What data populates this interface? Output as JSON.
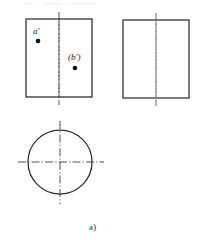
{
  "figure": {
    "type": "engineering-orthographic-projection",
    "caption": "a)",
    "background_color": "#ffffff",
    "line_color": "#2b2b2b",
    "centerline_color_primary": "#3a3a3a",
    "centerline_color_secondary": "#9a9a9a",
    "point_color": "#101010",
    "top_artifact_text": "— ·· —— · ———",
    "views": [
      {
        "id": "front-view",
        "name": "front-view-rectangle",
        "shape": "rectangle",
        "x": 26,
        "y": 19,
        "width": 66,
        "height": 78,
        "centerline": {
          "orientation": "vertical",
          "x": 59,
          "y1": 12,
          "y2": 105
        }
      },
      {
        "id": "side-view",
        "name": "side-view-rectangle",
        "shape": "rectangle",
        "x": 123,
        "y": 20,
        "width": 66,
        "height": 78,
        "centerline": {
          "orientation": "vertical",
          "x": 156,
          "y1": 13,
          "y2": 106
        }
      },
      {
        "id": "top-view",
        "name": "top-view-circle",
        "shape": "circle",
        "cx": 60,
        "cy": 162,
        "r": 32,
        "centerlines": [
          {
            "orientation": "vertical",
            "x": 60,
            "y1": 121,
            "y2": 204
          },
          {
            "orientation": "horizontal",
            "y": 162,
            "x1": 18,
            "x2": 104
          }
        ]
      }
    ],
    "points": [
      {
        "id": "point-a-prime",
        "label": "a′",
        "label_x": 33,
        "label_y": 27,
        "dot_x": 38,
        "dot_y": 41,
        "dot_r": 2.3,
        "visibility": "visible",
        "view": "front-view"
      },
      {
        "id": "point-b-prime",
        "label": "(b′)",
        "label_x": 68,
        "label_y": 53,
        "dot_x": 75,
        "dot_y": 68,
        "dot_r": 2.3,
        "visibility": "hidden-parenthesized",
        "view": "front-view"
      }
    ]
  }
}
